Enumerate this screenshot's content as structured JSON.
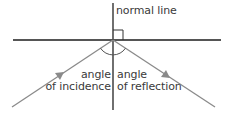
{
  "diagram": {
    "type": "reflection-of-light",
    "labels": {
      "normal": "normal line",
      "incidence_line1": "angle",
      "incidence_line2": "of incidence",
      "reflection_line1": "angle",
      "reflection_line2": "of reflection"
    },
    "colors": {
      "mirror": "#555555",
      "normal": "#333333",
      "rays": "#8a8a8a",
      "text": "#3a3a3a"
    },
    "geometry": {
      "point_of_incidence": [
        113,
        40
      ],
      "mirror": {
        "x1": 13,
        "x2": 221,
        "y": 40
      },
      "normal": {
        "x": 113,
        "y1": 3,
        "y2": 110
      },
      "incident_ray": {
        "from": [
          12,
          107
        ],
        "to": [
          113,
          40
        ]
      },
      "reflected_ray": {
        "from": [
          113,
          40
        ],
        "to": [
          215,
          107
        ]
      },
      "right_angle_marker": {
        "size": 10
      },
      "arc_radius": 15
    }
  }
}
